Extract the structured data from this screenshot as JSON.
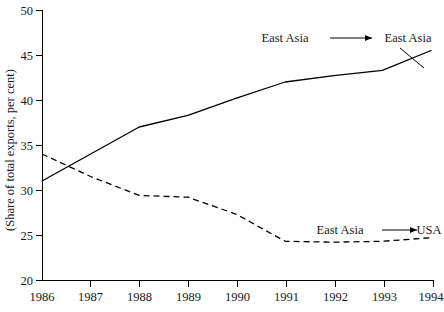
{
  "chart_data": {
    "type": "line",
    "title": "",
    "xlabel": "",
    "ylabel": "(Share of total exports, per cent)",
    "x": [
      1986,
      1987,
      1988,
      1989,
      1990,
      1991,
      1992,
      1993,
      1994
    ],
    "xticklabels": [
      "1986",
      "1987",
      "1988",
      "1989",
      "1990",
      "1991",
      "1992",
      "1993",
      "1994"
    ],
    "xlim": [
      1986,
      1994
    ],
    "ylim": [
      20,
      50
    ],
    "yticks": [
      20,
      25,
      30,
      35,
      40,
      45,
      50
    ],
    "yticklabels": [
      "20",
      "25",
      "30",
      "35",
      "40",
      "45",
      "50"
    ],
    "grid": false,
    "legend_position": "inline-annotations",
    "series": [
      {
        "name": "East Asia to East Asia",
        "style": "solid",
        "color": "#000000",
        "values": [
          31.0,
          34.0,
          37.0,
          38.3,
          40.2,
          42.0,
          42.7,
          43.3,
          45.5
        ]
      },
      {
        "name": "East Asia to USA",
        "style": "dashed",
        "color": "#000000",
        "values": [
          34.0,
          31.5,
          29.4,
          29.2,
          27.3,
          24.3,
          24.2,
          24.3,
          24.7
        ]
      }
    ],
    "annotations": [
      {
        "id": "annotation-east-asia-east-asia",
        "source_label": "East Asia",
        "target_label": "East Asia",
        "arrow": "⟶"
      },
      {
        "id": "annotation-east-asia-usa",
        "source_label": "East Asia",
        "target_label": "USA",
        "arrow": "⟶"
      }
    ]
  },
  "ylabel": {
    "text": "(Share of total exports, per cent)"
  },
  "annotations": {
    "top": {
      "source": "East Asia",
      "target": "East Asia"
    },
    "bottom": {
      "source": "East Asia",
      "target": "USA"
    }
  },
  "yticks": [
    {
      "label": "50"
    },
    {
      "label": "45"
    },
    {
      "label": "40"
    },
    {
      "label": "35"
    },
    {
      "label": "30"
    },
    {
      "label": "25"
    },
    {
      "label": "20"
    }
  ],
  "xticks": [
    {
      "label": "1986"
    },
    {
      "label": "1987"
    },
    {
      "label": "1988"
    },
    {
      "label": "1989"
    },
    {
      "label": "1990"
    },
    {
      "label": "1991"
    },
    {
      "label": "1992"
    },
    {
      "label": "1993"
    },
    {
      "label": "1994"
    }
  ]
}
